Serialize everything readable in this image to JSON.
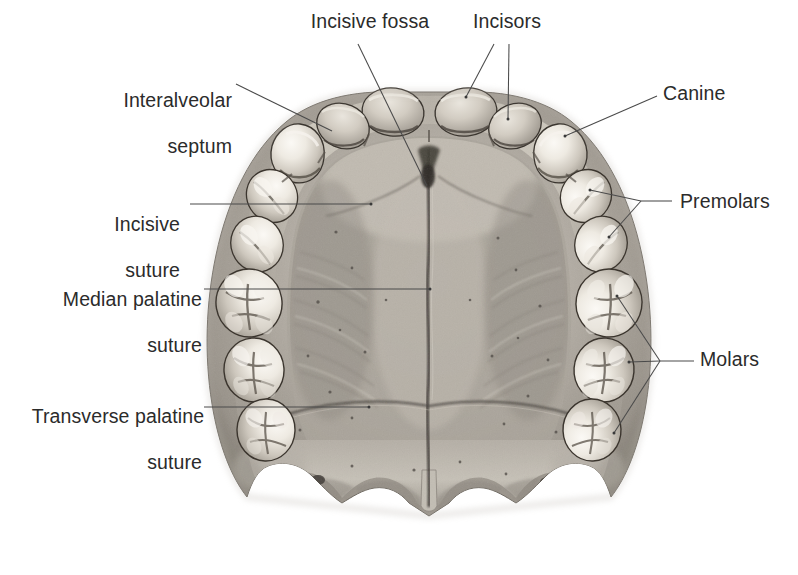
{
  "figure": {
    "kind": "anatomical-photograph",
    "palette": {
      "background": "#ffffff",
      "text": "#2b2b2b",
      "leader_line": "#4a4a4a",
      "bone_light": "#d8d4cd",
      "bone_mid": "#a9a49c",
      "bone_dark": "#7d7870",
      "suture_dark": "#2f2c28",
      "tooth_light": "#f2efe9",
      "tooth_shadow": "#b0aba3"
    }
  },
  "labels": [
    {
      "id": "incisive-fossa",
      "text": "Incisive fossa",
      "lines": [
        "Incisive fossa"
      ],
      "align": "center",
      "x": 290,
      "y": 10,
      "width": 160
    },
    {
      "id": "incisors",
      "text": "Incisors",
      "lines": [
        "Incisors"
      ],
      "align": "center",
      "x": 452,
      "y": 10,
      "width": 110
    },
    {
      "id": "interalveolar-septum",
      "text": "Interalveolar septum",
      "lines": [
        "Interalveolar",
        "septum"
      ],
      "align": "right",
      "x": 70,
      "y": 66,
      "width": 162
    },
    {
      "id": "canine",
      "text": "Canine",
      "lines": [
        "Canine"
      ],
      "align": "left",
      "x": 663,
      "y": 82,
      "width": 110
    },
    {
      "id": "incisive-suture",
      "text": "Incisive suture",
      "lines": [
        "Incisive",
        "suture"
      ],
      "align": "right",
      "x": 68,
      "y": 190,
      "width": 112
    },
    {
      "id": "premolars",
      "text": "Premolars",
      "lines": [
        "Premolars"
      ],
      "align": "left",
      "x": 680,
      "y": 190,
      "width": 118
    },
    {
      "id": "median-palatine-suture",
      "text": "Median palatine suture",
      "lines": [
        "Median palatine",
        "suture"
      ],
      "align": "right",
      "x": 34,
      "y": 265,
      "width": 168
    },
    {
      "id": "molars",
      "text": "Molars",
      "lines": [
        "Molars"
      ],
      "align": "left",
      "x": 700,
      "y": 348,
      "width": 92
    },
    {
      "id": "transverse-palatine-suture",
      "text": "Transverse palatine suture",
      "lines": [
        "Transverse palatine",
        "suture"
      ],
      "align": "right",
      "x": 10,
      "y": 382,
      "width": 192
    }
  ],
  "leaders": [
    {
      "id": "leader-incisive-fossa",
      "for": "incisive-fossa",
      "points": [
        [
          358,
          44
        ],
        [
          427,
          186
        ]
      ]
    },
    {
      "id": "leader-incisors-1",
      "for": "incisors",
      "points": [
        [
          494,
          44
        ],
        [
          466,
          97
        ]
      ]
    },
    {
      "id": "leader-incisors-2",
      "for": "incisors",
      "points": [
        [
          509,
          44
        ],
        [
          508,
          119
        ]
      ]
    },
    {
      "id": "leader-interalveolar",
      "for": "interalveolar-septum",
      "points": [
        [
          236,
          84
        ],
        [
          332,
          131
        ]
      ]
    },
    {
      "id": "leader-canine",
      "for": "canine",
      "points": [
        [
          657,
          96
        ],
        [
          565,
          136
        ]
      ]
    },
    {
      "id": "leader-incisive-suture",
      "for": "incisive-suture",
      "points": [
        [
          190,
          204
        ],
        [
          371,
          204
        ]
      ]
    },
    {
      "id": "leader-premolars",
      "for": "premolars",
      "points": [
        [
          672,
          201
        ],
        [
          641,
          201
        ]
      ]
    },
    {
      "id": "leader-premolars-a",
      "for": "premolars",
      "points": [
        [
          641,
          201
        ],
        [
          590,
          190
        ]
      ]
    },
    {
      "id": "leader-premolars-b",
      "for": "premolars",
      "points": [
        [
          641,
          201
        ],
        [
          609,
          237
        ]
      ]
    },
    {
      "id": "leader-median-suture",
      "for": "median-palatine-suture",
      "points": [
        [
          204,
          289
        ],
        [
          430,
          289
        ]
      ]
    },
    {
      "id": "leader-molars",
      "for": "molars",
      "points": [
        [
          694,
          361
        ],
        [
          660,
          361
        ]
      ]
    },
    {
      "id": "leader-molars-a",
      "for": "molars",
      "points": [
        [
          660,
          361
        ],
        [
          617,
          296
        ]
      ]
    },
    {
      "id": "leader-molars-b",
      "for": "molars",
      "points": [
        [
          660,
          361
        ],
        [
          629,
          362
        ]
      ]
    },
    {
      "id": "leader-molars-c",
      "for": "molars",
      "points": [
        [
          660,
          361
        ],
        [
          614,
          433
        ]
      ]
    },
    {
      "id": "leader-transverse-suture",
      "for": "transverse-palatine-suture",
      "points": [
        [
          204,
          407
        ],
        [
          369,
          407
        ]
      ]
    }
  ],
  "teeth": {
    "right_arch": [
      {
        "id": "tooth-incisor-central-r",
        "name": "central incisor",
        "type": "incisor",
        "cx": 466,
        "cy": 113,
        "rx": 30,
        "ry": 23,
        "rot": -8
      },
      {
        "id": "tooth-incisor-lateral-r",
        "name": "lateral incisor",
        "type": "incisor",
        "cx": 513,
        "cy": 124,
        "rx": 26,
        "ry": 22,
        "rot": -22
      },
      {
        "id": "tooth-canine-r",
        "name": "canine",
        "type": "canine",
        "cx": 559,
        "cy": 147,
        "rx": 27,
        "ry": 25,
        "rot": -38
      },
      {
        "id": "tooth-premolar1-r",
        "name": "first premolar",
        "type": "premolar",
        "cx": 586,
        "cy": 195,
        "rx": 26,
        "ry": 24,
        "rot": -58
      },
      {
        "id": "tooth-premolar2-r",
        "name": "second premolar",
        "type": "premolar",
        "cx": 601,
        "cy": 243,
        "rx": 27,
        "ry": 25,
        "rot": -70
      },
      {
        "id": "tooth-molar1-r",
        "name": "first molar",
        "type": "molar",
        "cx": 609,
        "cy": 302,
        "rx": 32,
        "ry": 32,
        "rot": -80
      },
      {
        "id": "tooth-molar2-r",
        "name": "second molar",
        "type": "molar",
        "cx": 604,
        "cy": 368,
        "rx": 31,
        "ry": 30,
        "rot": -86
      },
      {
        "id": "tooth-molar3-r",
        "name": "third molar",
        "type": "molar",
        "cx": 592,
        "cy": 428,
        "rx": 31,
        "ry": 29,
        "rot": -92
      }
    ],
    "left_arch": [
      {
        "id": "tooth-incisor-central-l",
        "name": "central incisor",
        "type": "incisor",
        "cx": 392,
        "cy": 113,
        "rx": 30,
        "ry": 23,
        "rot": 8
      },
      {
        "id": "tooth-incisor-lateral-l",
        "name": "lateral incisor",
        "type": "incisor",
        "cx": 345,
        "cy": 124,
        "rx": 26,
        "ry": 22,
        "rot": 22
      },
      {
        "id": "tooth-canine-l",
        "name": "canine",
        "type": "canine",
        "cx": 299,
        "cy": 147,
        "rx": 27,
        "ry": 25,
        "rot": 38
      },
      {
        "id": "tooth-premolar1-l",
        "name": "first premolar",
        "type": "premolar",
        "cx": 272,
        "cy": 195,
        "rx": 26,
        "ry": 24,
        "rot": 58
      },
      {
        "id": "tooth-premolar2-l",
        "name": "second premolar",
        "type": "premolar",
        "cx": 257,
        "cy": 243,
        "rx": 27,
        "ry": 25,
        "rot": 70
      },
      {
        "id": "tooth-molar1-l",
        "name": "first molar",
        "type": "molar",
        "cx": 249,
        "cy": 302,
        "rx": 32,
        "ry": 32,
        "rot": 80
      },
      {
        "id": "tooth-molar2-l",
        "name": "second molar",
        "type": "molar",
        "cx": 254,
        "cy": 368,
        "rx": 31,
        "ry": 30,
        "rot": 86
      },
      {
        "id": "tooth-molar3-l",
        "name": "third molar",
        "type": "molar",
        "cx": 266,
        "cy": 428,
        "rx": 31,
        "ry": 29,
        "rot": 92
      }
    ]
  },
  "structures": [
    {
      "id": "median-palatine-suture-line",
      "name": "median palatine suture",
      "orientation": "vertical",
      "x": 429,
      "y1": 150,
      "y2": 505
    },
    {
      "id": "transverse-palatine-suture-line",
      "name": "transverse palatine suture",
      "orientation": "horizontal",
      "y": 404,
      "x1": 300,
      "x2": 560
    },
    {
      "id": "incisive-suture-line",
      "name": "incisive suture",
      "orientation": "curve",
      "x": 371,
      "y": 204
    },
    {
      "id": "incisive-fossa-mark",
      "name": "incisive fossa",
      "orientation": "point",
      "x": 428,
      "y": 182
    },
    {
      "id": "posterior-nasal-spine",
      "name": "posterior nasal spine",
      "orientation": "point",
      "x": 429,
      "y": 520
    },
    {
      "id": "pterygoid-hamulus-left",
      "name": "pterygoid hamulus",
      "orientation": "point",
      "x": 248,
      "y": 548
    },
    {
      "id": "pterygoid-hamulus-right",
      "name": "pterygoid hamulus",
      "orientation": "point",
      "x": 600,
      "y": 552
    }
  ]
}
